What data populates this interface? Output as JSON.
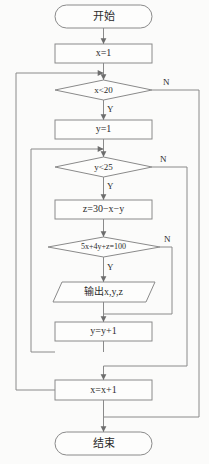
{
  "diagram": {
    "language": "zh-CN",
    "colors": {
      "background": "#fbfbfa",
      "shape_fill": "#fdfdfc",
      "stroke": "#8a8a8a",
      "text": "#2b2b2b"
    },
    "nodes": {
      "start": {
        "label": "开始",
        "type": "terminator"
      },
      "init_x": {
        "label": "x=1",
        "type": "process"
      },
      "cond_x": {
        "label": "x<20",
        "type": "decision"
      },
      "init_y": {
        "label": "y=1",
        "type": "process"
      },
      "cond_y": {
        "label": "y<25",
        "type": "decision"
      },
      "calc_z": {
        "label": "z=30−x−y",
        "type": "process"
      },
      "cond_eq": {
        "label": "5x+4y+z=100",
        "type": "decision"
      },
      "output": {
        "label": "输出x,y,z",
        "type": "input-output"
      },
      "incr_y": {
        "label": "y=y+1",
        "type": "process"
      },
      "incr_x": {
        "label": "x=x+1",
        "type": "process"
      },
      "end": {
        "label": "结束",
        "type": "terminator"
      }
    },
    "branch_labels": {
      "cond_x_no": "N",
      "cond_x_yes": "Y",
      "cond_y_no": "N",
      "cond_y_yes": "Y",
      "cond_eq_no": "N",
      "cond_eq_yes": "Y"
    }
  }
}
